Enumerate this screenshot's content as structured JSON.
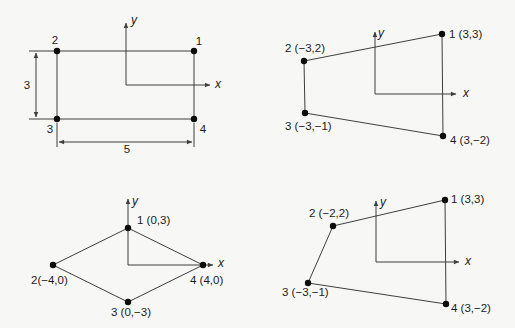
{
  "style": {
    "background": "#f7f7f5",
    "line_color": "#3f3f3f",
    "dot_color": "#0d0d0d",
    "text_color": "#1c1c1c",
    "dot_radius": 3.2
  },
  "diagrams": [
    {
      "name": "rectangle-3-by-5",
      "axis": {
        "origin": [
          126,
          85
        ],
        "x_tip": [
          210,
          85
        ],
        "y_tip": [
          126,
          23
        ]
      },
      "points": [
        {
          "id": "1",
          "x": 194,
          "y": 51,
          "label": "1",
          "label_pos": [
            199,
            45
          ],
          "anchor": "middle"
        },
        {
          "id": "2",
          "x": 57,
          "y": 51,
          "label": "2",
          "label_pos": [
            55,
            44
          ],
          "anchor": "middle"
        },
        {
          "id": "3",
          "x": 57,
          "y": 119,
          "label": "3",
          "label_pos": [
            50,
            133
          ],
          "anchor": "middle"
        },
        {
          "id": "4",
          "x": 194,
          "y": 119,
          "label": "4",
          "label_pos": [
            203,
            133
          ],
          "anchor": "middle"
        }
      ],
      "extra_lines": [
        {
          "name": "extension-line-top-left",
          "from": [
            29,
            51
          ],
          "to": [
            57,
            51
          ]
        },
        {
          "name": "extension-line-bottom-left",
          "from": [
            29,
            119
          ],
          "to": [
            57,
            119
          ]
        },
        {
          "name": "dimension-line-height",
          "from": [
            36,
            53
          ],
          "to": [
            36,
            117
          ],
          "arrows": true
        },
        {
          "name": "extension-line-below-3",
          "from": [
            57,
            123
          ],
          "to": [
            57,
            147
          ]
        },
        {
          "name": "extension-line-below-4",
          "from": [
            194,
            123
          ],
          "to": [
            194,
            147
          ]
        },
        {
          "name": "dimension-line-width",
          "from": [
            59,
            142
          ],
          "to": [
            192,
            142
          ],
          "arrows": true
        }
      ],
      "texts": [
        {
          "name": "dimension-label-height",
          "text": "3",
          "pos": [
            27,
            89
          ],
          "anchor": "middle"
        },
        {
          "name": "dimension-label-width",
          "text": "5",
          "pos": [
            127,
            153
          ],
          "anchor": "middle"
        },
        {
          "name": "x-axis-label",
          "text": "x",
          "pos": [
            215,
            88
          ],
          "anchor": "start",
          "italic": true
        },
        {
          "name": "y-axis-label",
          "text": "y",
          "pos": [
            131,
            24
          ],
          "anchor": "start",
          "italic": true
        }
      ]
    },
    {
      "name": "trapezoid-coordinates",
      "axis": {
        "origin": [
          118,
          94
        ],
        "x_tip": [
          199,
          94
        ],
        "y_tip": [
          118,
          32
        ]
      },
      "points": [
        {
          "id": "1",
          "x": 185,
          "y": 34,
          "label": "1 (3,3)",
          "label_pos": [
            192,
            38
          ],
          "anchor": "start"
        },
        {
          "id": "2",
          "x": 47,
          "y": 61,
          "label": "2 (−3,2)",
          "label_pos": [
            48,
            52
          ],
          "anchor": "middle"
        },
        {
          "id": "3",
          "x": 48,
          "y": 113,
          "label": "3 (−3,−1)",
          "label_pos": [
            28,
            130
          ],
          "anchor": "start"
        },
        {
          "id": "4",
          "x": 186,
          "y": 136,
          "label": "4 (3,−2)",
          "label_pos": [
            193,
            144
          ],
          "anchor": "start"
        }
      ],
      "extra_lines": [],
      "texts": [
        {
          "name": "x-axis-label",
          "text": "x",
          "pos": [
            206,
            97
          ],
          "anchor": "start",
          "italic": true
        },
        {
          "name": "y-axis-label",
          "text": "y",
          "pos": [
            121,
            37
          ],
          "anchor": "start",
          "italic": true
        }
      ]
    },
    {
      "name": "rhombus-coordinates",
      "axis": {
        "origin": [
          128,
          101
        ],
        "x_tip": [
          213,
          101
        ],
        "y_tip": [
          128,
          35
        ]
      },
      "points": [
        {
          "id": "1",
          "x": 128,
          "y": 64,
          "label": "1 (0,3)",
          "label_pos": [
            137,
            60
          ],
          "anchor": "start"
        },
        {
          "id": "2",
          "x": 53,
          "y": 101,
          "label": "2(−4,0)",
          "label_pos": [
            31,
            120
          ],
          "anchor": "start"
        },
        {
          "id": "3",
          "x": 128,
          "y": 138,
          "label": "3 (0,−3)",
          "label_pos": [
            131,
            152
          ],
          "anchor": "middle"
        },
        {
          "id": "4",
          "x": 203,
          "y": 101,
          "label": "4 (4,0)",
          "label_pos": [
            190,
            120
          ],
          "anchor": "start"
        }
      ],
      "extra_lines": [],
      "texts": [
        {
          "name": "x-axis-label",
          "text": "x",
          "pos": [
            218,
            103
          ],
          "anchor": "start",
          "italic": true
        },
        {
          "name": "y-axis-label",
          "text": "y",
          "pos": [
            132,
            41
          ],
          "anchor": "start",
          "italic": true
        }
      ]
    },
    {
      "name": "quadrilateral-coordinates",
      "axis": {
        "origin": [
          119,
          98
        ],
        "x_tip": [
          202,
          98
        ],
        "y_tip": [
          119,
          37
        ]
      },
      "points": [
        {
          "id": "1",
          "x": 188,
          "y": 36,
          "label": "1 (3,3)",
          "label_pos": [
            194,
            39
          ],
          "anchor": "start"
        },
        {
          "id": "2",
          "x": 76,
          "y": 62,
          "label": "2 (−2,2)",
          "label_pos": [
            72,
            53
          ],
          "anchor": "middle"
        },
        {
          "id": "3",
          "x": 51,
          "y": 119,
          "label": "3 (−3,−1)",
          "label_pos": [
            25,
            132
          ],
          "anchor": "start"
        },
        {
          "id": "4",
          "x": 189,
          "y": 140,
          "label": "4 (3,−2)",
          "label_pos": [
            194,
            148
          ],
          "anchor": "start"
        }
      ],
      "extra_lines": [],
      "texts": [
        {
          "name": "x-axis-label",
          "text": "x",
          "pos": [
            208,
            101
          ],
          "anchor": "start",
          "italic": true
        },
        {
          "name": "y-axis-label",
          "text": "y",
          "pos": [
            123,
            42
          ],
          "anchor": "start",
          "italic": true
        }
      ]
    }
  ]
}
